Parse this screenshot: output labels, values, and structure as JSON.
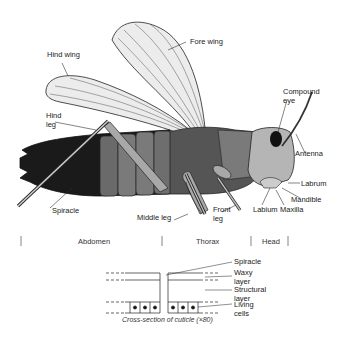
{
  "diagram": {
    "labels": {
      "fore_wing": "Fore wing",
      "hind_wing": "Hind wing",
      "hind_leg": "Hind\nleg",
      "compound_eye": "Compound\neye",
      "antenna": "Antenna",
      "labrum": "Labrum",
      "mandible": "Mandible",
      "maxilla": "Maxilla",
      "labium": "Labium",
      "front_leg": "Front\nleg",
      "middle_leg": "Middle leg",
      "spiracle": "Spiracle"
    },
    "body_sections": [
      "Abdomen",
      "Thorax",
      "Head"
    ],
    "cuticle": {
      "labels": {
        "spiracle": "Spiracle",
        "waxy_layer": "Waxy\nlayer",
        "structural_layer": "Structural\nlayer",
        "living_cells": "Living\ncells"
      },
      "caption": "Cross-section of cuticle (×80)"
    },
    "colors": {
      "line": "#222222",
      "wing_fill": "#ececec",
      "abdomen_dark": "#1a1a1a",
      "body_mid": "#6a6a6a",
      "head_fill": "#b5b5b5",
      "leg_fill": "#a8a8a8"
    }
  }
}
